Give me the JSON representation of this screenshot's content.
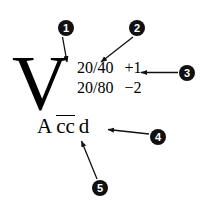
{
  "figure": {
    "background_color": "#ffffff",
    "ink_color": "#000000",
    "marker_fill_color": "#111111",
    "marker_text_color": "#ffffff"
  },
  "notation": {
    "modality_symbol": "V",
    "acuity_rows": [
      {
        "measurement": "20/40",
        "correction": "+1"
      },
      {
        "measurement": "20/80",
        "correction": "−2"
      }
    ],
    "bottom_line": {
      "prefix": "A",
      "overlined": "cc",
      "suffix": "d"
    }
  },
  "callouts": [
    {
      "number": "1",
      "leader": "diagonal-down-right"
    },
    {
      "number": "2",
      "leader": "diagonal-down-left"
    },
    {
      "number": "3",
      "leader": "horizontal-left"
    },
    {
      "number": "4",
      "leader": "horizontal-left"
    },
    {
      "number": "5",
      "leader": "diagonal-up-left"
    }
  ]
}
